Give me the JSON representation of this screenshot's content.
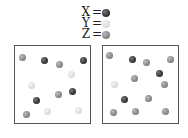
{
  "legend": [
    {
      "label": "X",
      "eq": "=",
      "species": "dark",
      "color": "#3a3a3a"
    },
    {
      "label": "Y",
      "eq": "=",
      "species": "light",
      "color": "#dcdcdc"
    },
    {
      "label": "Z",
      "eq": "=",
      "species": "mid",
      "color": "#8a8a8a"
    }
  ],
  "boxes": [
    {
      "name": "box-left",
      "particles": [
        {
          "type": "Z",
          "x": 22,
          "y": 57
        },
        {
          "type": "X",
          "x": 44,
          "y": 60
        },
        {
          "type": "Z",
          "x": 59,
          "y": 64
        },
        {
          "type": "X",
          "x": 83,
          "y": 60
        },
        {
          "type": "Y",
          "x": 71,
          "y": 74
        },
        {
          "type": "Y",
          "x": 31,
          "y": 85
        },
        {
          "type": "Z",
          "x": 58,
          "y": 94
        },
        {
          "type": "X",
          "x": 72,
          "y": 91
        },
        {
          "type": "X",
          "x": 36,
          "y": 100
        },
        {
          "type": "Z",
          "x": 26,
          "y": 114
        },
        {
          "type": "Y",
          "x": 47,
          "y": 111
        },
        {
          "type": "Y",
          "x": 78,
          "y": 110
        }
      ]
    },
    {
      "name": "box-right",
      "particles": [
        {
          "type": "Z",
          "x": 109,
          "y": 55
        },
        {
          "type": "X",
          "x": 132,
          "y": 59
        },
        {
          "type": "Z",
          "x": 146,
          "y": 62
        },
        {
          "type": "Z",
          "x": 170,
          "y": 59
        },
        {
          "type": "X",
          "x": 159,
          "y": 73
        },
        {
          "type": "Z",
          "x": 134,
          "y": 78
        },
        {
          "type": "Y",
          "x": 114,
          "y": 84
        },
        {
          "type": "Z",
          "x": 164,
          "y": 84
        },
        {
          "type": "X",
          "x": 124,
          "y": 99
        },
        {
          "type": "Z",
          "x": 148,
          "y": 98
        },
        {
          "type": "Z",
          "x": 113,
          "y": 112
        },
        {
          "type": "Z",
          "x": 135,
          "y": 111
        },
        {
          "type": "Z",
          "x": 165,
          "y": 111
        }
      ]
    }
  ]
}
